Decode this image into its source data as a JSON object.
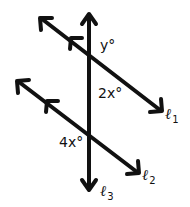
{
  "diagram": {
    "stroke_color": "#111111",
    "angles": [
      {
        "id": "y",
        "label": "y°"
      },
      {
        "id": "2x",
        "label": "2x°"
      },
      {
        "id": "4x",
        "label": "4x°"
      }
    ],
    "lines": [
      {
        "id": "l1",
        "symbol": "ℓ",
        "subscript": "1",
        "parallel_to": "l2"
      },
      {
        "id": "l2",
        "symbol": "ℓ",
        "subscript": "2",
        "parallel_to": "l1"
      },
      {
        "id": "l3",
        "symbol": "ℓ",
        "subscript": "3",
        "role": "transversal"
      }
    ]
  }
}
